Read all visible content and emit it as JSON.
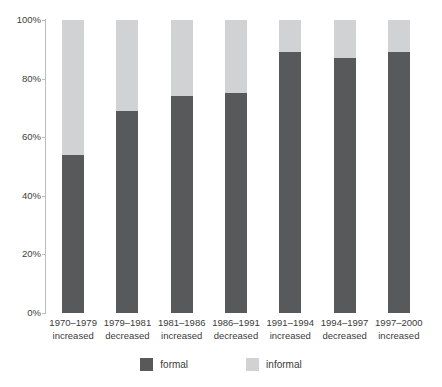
{
  "chart_data": {
    "type": "bar",
    "subtype": "stacked-100-percent",
    "title": "",
    "subtitle": "",
    "xlabel": "",
    "ylabel": "",
    "ylim": [
      0,
      100
    ],
    "grid": false,
    "legend_position": "bottom-center",
    "categories": [
      "1970–1979 increased",
      "1979–1981 decreased",
      "1981–1986 increased",
      "1986–1991 decreased",
      "1991–1994 increased",
      "1994–1997 decreased",
      "1997–2000 increased"
    ],
    "category_lines": [
      {
        "period": "1970–1979",
        "direction": "increased"
      },
      {
        "period": "1979–1981",
        "direction": "decreased"
      },
      {
        "period": "1981–1986",
        "direction": "increased"
      },
      {
        "period": "1986–1991",
        "direction": "decreased"
      },
      {
        "period": "1991–1994",
        "direction": "increased"
      },
      {
        "period": "1994–1997",
        "direction": "decreased"
      },
      {
        "period": "1997–2000",
        "direction": "increased"
      }
    ],
    "series": [
      {
        "name": "formal",
        "color": "#58595b",
        "values": [
          54,
          69,
          74,
          75,
          89,
          87,
          89
        ]
      },
      {
        "name": "informal",
        "color": "#d0d2d3",
        "values": [
          46,
          31,
          26,
          25,
          11,
          13,
          11
        ]
      }
    ],
    "y_ticks": [
      0,
      20,
      40,
      60,
      80,
      100
    ],
    "y_tick_labels": [
      "0%",
      "20%",
      "40%",
      "60%",
      "80%",
      "100%"
    ]
  },
  "legend": {
    "items": [
      {
        "label": "formal",
        "color": "#58595b"
      },
      {
        "label": "informal",
        "color": "#d0d2d3"
      }
    ]
  },
  "colors": {
    "formal": "#58595b",
    "informal": "#d0d2d3",
    "axis": "#bcbec0",
    "text": "#3b3b3b",
    "background": "#ffffff"
  }
}
